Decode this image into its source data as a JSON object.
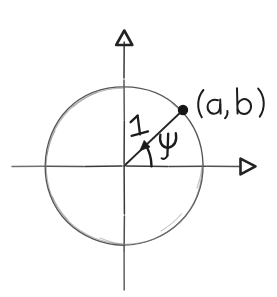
{
  "figure": {
    "kind": "hand-drawn-diagram",
    "title": "Unit circle with point (a, b) at angle psi",
    "background_color": "#ffffff",
    "ink_color": "#2b2b2b",
    "width": 277,
    "height": 297
  },
  "axes": {
    "vertical": {
      "name": "vertical-axis",
      "arrow_direction": "up",
      "arrowhead_style": "hollow-triangle",
      "x": 124,
      "y_top": 30,
      "y_bottom": 291
    },
    "horizontal": {
      "name": "horizontal-axis",
      "arrow_direction": "right",
      "arrowhead_style": "hollow-triangle",
      "y": 166,
      "x_left": 12,
      "x_right": 256
    }
  },
  "circle": {
    "name": "unit-circle",
    "center_x": 124,
    "center_y": 166,
    "radius": 79,
    "stroke_color": "#555555",
    "style": "sketchy"
  },
  "origin": {
    "x": 124,
    "y": 166
  },
  "point": {
    "name": "point-on-circle",
    "x": 183,
    "y": 110,
    "dot_radius": 4.6,
    "label": "(a, b)",
    "label_x": 197,
    "label_y": 112,
    "angle_degrees": 44
  },
  "radius_segment": {
    "name": "radius-segment",
    "label": "1",
    "label_x": 135,
    "label_y": 128,
    "from_x": 124,
    "from_y": 166,
    "to_x": 183,
    "to_y": 110
  },
  "angle": {
    "name": "angle-psi",
    "symbol": "ψ",
    "label": "ψ",
    "label_x": 163,
    "label_y": 150,
    "arc_radius": 26,
    "arc_start_degrees": 0,
    "arc_end_degrees": 44,
    "arrow_at": "end"
  },
  "labels": {
    "point_label": "(a, b)",
    "radius_label": "1",
    "angle_label": "ψ"
  }
}
